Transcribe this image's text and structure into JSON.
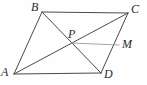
{
  "figure": {
    "name": "parallelogram-with-diagonals",
    "background_color": "#fefefe",
    "width": 147,
    "height": 85
  },
  "style": {
    "stroke_color": "#4a4a4a",
    "light_stroke_color": "#9a9a9a",
    "stroke_width": 1,
    "light_stroke_width": 0.9,
    "label_color": "#2b2b2b",
    "label_font_size": 12
  },
  "points": [
    {
      "id": "A",
      "label": "A",
      "x": 14,
      "y": 74,
      "label_x": 1,
      "label_y": 66
    },
    {
      "id": "B",
      "label": "B",
      "x": 42,
      "y": 12,
      "label_x": 31,
      "label_y": 1
    },
    {
      "id": "C",
      "label": "C",
      "x": 128,
      "y": 13,
      "label_x": 131,
      "label_y": 3
    },
    {
      "id": "D",
      "label": "D",
      "x": 101,
      "y": 73,
      "label_x": 104,
      "label_y": 68
    },
    {
      "id": "P",
      "label": "P",
      "x": 71,
      "y": 43,
      "label_x": 68,
      "label_y": 28
    },
    {
      "id": "M",
      "label": "M",
      "x": 119,
      "y": 45,
      "label_x": 122,
      "label_y": 38
    }
  ],
  "segments": [
    {
      "id": "AB",
      "from": "A",
      "to": "B",
      "weight": "normal"
    },
    {
      "id": "BC",
      "from": "B",
      "to": "C",
      "weight": "normal"
    },
    {
      "id": "CD",
      "from": "C",
      "to": "D",
      "weight": "normal"
    },
    {
      "id": "DA",
      "from": "D",
      "to": "A",
      "weight": "normal"
    },
    {
      "id": "AC",
      "from": "A",
      "to": "C",
      "weight": "normal"
    },
    {
      "id": "BD",
      "from": "B",
      "to": "D",
      "weight": "normal"
    },
    {
      "id": "PM",
      "from": "P",
      "to": "M",
      "weight": "light"
    }
  ]
}
